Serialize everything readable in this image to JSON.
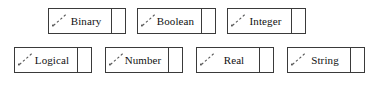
{
  "diagram": {
    "type": "uml-datatype-palette",
    "canvas": {
      "width": 380,
      "height": 85,
      "background": "#ffffff"
    },
    "style": {
      "border_color": "#3a3a3a",
      "fill_color": "#ffffff",
      "text_color": "#111111",
      "icon_color": "#555555"
    },
    "icon_name": "dashed-diagonal-arrow-icon",
    "rows": [
      {
        "row_label": "row-1",
        "nodes": [
          {
            "label": "Binary",
            "x": 48,
            "y": 8,
            "width": 78,
            "height": 26
          },
          {
            "label": "Boolean",
            "x": 137,
            "y": 8,
            "width": 79,
            "height": 26
          },
          {
            "label": "Integer",
            "x": 227,
            "y": 8,
            "width": 79,
            "height": 26
          }
        ]
      },
      {
        "row_label": "row-2",
        "nodes": [
          {
            "label": "Logical",
            "x": 14,
            "y": 47,
            "width": 78,
            "height": 26
          },
          {
            "label": "Number",
            "x": 105,
            "y": 47,
            "width": 78,
            "height": 26
          },
          {
            "label": "Real",
            "x": 196,
            "y": 47,
            "width": 78,
            "height": 26
          },
          {
            "label": "String",
            "x": 287,
            "y": 47,
            "width": 78,
            "height": 26
          }
        ]
      }
    ]
  }
}
